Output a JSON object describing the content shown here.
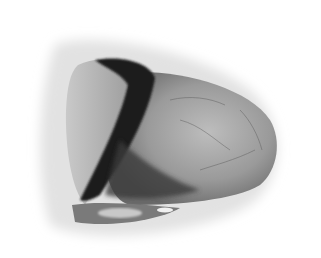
{
  "image": {
    "subject": "heart volume rendering",
    "style": "grayscale",
    "colors": {
      "background": "#ffffff",
      "halo": "#e4e4e4",
      "surface_light": "#b8b8b8",
      "surface_mid": "#8a8a8a",
      "surface_dark": "#2a2a2a"
    }
  }
}
